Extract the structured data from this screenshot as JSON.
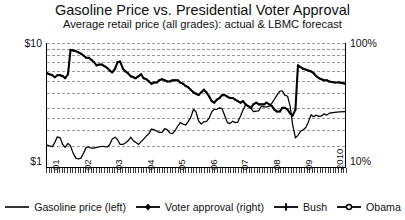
{
  "chart": {
    "title": "Gasoline Price vs. Presidential Voter Approval",
    "subtitle": "Average retail price (all grades): actual & LBMC forecast"
  },
  "axes": {
    "left_top_label": "$10",
    "left_bottom_label": "$1",
    "right_top_label": "100%",
    "right_bottom_label": "10%"
  },
  "legend": {
    "items": [
      {
        "label": "Gasoline price (left)",
        "marker": "line",
        "color": "#000000"
      },
      {
        "label": "Voter approval (right)",
        "marker": "line-diamond",
        "color": "#000000"
      },
      {
        "label": "Bush",
        "marker": "line-plus",
        "color": "#000000"
      },
      {
        "label": "Obama",
        "marker": "line-circle",
        "color": "#000000"
      }
    ]
  },
  "chart_data": {
    "type": "line",
    "title": "Gasoline Price vs. Presidential Voter Approval",
    "subtitle": "Average retail price (all grades): actual & LBMC forecast",
    "xlabel": "",
    "ylabel": "Gasoline price (USD per gallon)",
    "y2label": "Voter approval (%)",
    "yscale": "log",
    "y2scale": "log",
    "ylim": [
      1,
      10
    ],
    "y2lim": [
      10,
      100
    ],
    "grid": true,
    "legend_position": "bottom",
    "x_tick_labels": [
      "01",
      "02",
      "03",
      "04",
      "05",
      "06",
      "07",
      "08",
      "09",
      "2010"
    ],
    "x_tick_values": [
      2001,
      2002,
      2003,
      2004,
      2005,
      2006,
      2007,
      2008,
      2009,
      2010
    ],
    "x_minor_ticks": "monthly",
    "xlim": [
      2001,
      2010.5
    ],
    "series": [
      {
        "name": "Gasoline price (left)",
        "axis": "left",
        "unit": "USD/gal",
        "marker": "none",
        "x": [
          2001.0,
          2001.08,
          2001.17,
          2001.25,
          2001.33,
          2001.42,
          2001.5,
          2001.58,
          2001.67,
          2001.75,
          2001.83,
          2001.92,
          2002.0,
          2002.08,
          2002.17,
          2002.25,
          2002.33,
          2002.42,
          2002.5,
          2002.58,
          2002.67,
          2002.75,
          2002.83,
          2002.92,
          2003.0,
          2003.08,
          2003.17,
          2003.25,
          2003.33,
          2003.42,
          2003.5,
          2003.58,
          2003.67,
          2003.75,
          2003.83,
          2003.92,
          2004.0,
          2004.08,
          2004.17,
          2004.25,
          2004.33,
          2004.42,
          2004.5,
          2004.58,
          2004.67,
          2004.75,
          2004.83,
          2004.92,
          2005.0,
          2005.08,
          2005.17,
          2005.25,
          2005.33,
          2005.42,
          2005.5,
          2005.58,
          2005.67,
          2005.75,
          2005.83,
          2005.92,
          2006.0,
          2006.08,
          2006.17,
          2006.25,
          2006.33,
          2006.42,
          2006.5,
          2006.58,
          2006.67,
          2006.75,
          2006.83,
          2006.92,
          2007.0,
          2007.08,
          2007.17,
          2007.25,
          2007.33,
          2007.42,
          2007.5,
          2007.58,
          2007.67,
          2007.75,
          2007.83,
          2007.92,
          2008.0,
          2008.08,
          2008.17,
          2008.25,
          2008.33,
          2008.42,
          2008.5,
          2008.58,
          2008.67,
          2008.75,
          2008.83,
          2008.92,
          2009.0,
          2009.08,
          2009.17,
          2009.25,
          2009.33,
          2009.42,
          2009.5,
          2009.58,
          2009.67,
          2009.75,
          2009.83,
          2009.92,
          2010.0,
          2010.17,
          2010.33,
          2010.5
        ],
        "y": [
          1.5,
          1.48,
          1.46,
          1.58,
          1.75,
          1.72,
          1.52,
          1.44,
          1.55,
          1.48,
          1.3,
          1.18,
          1.16,
          1.18,
          1.3,
          1.44,
          1.45,
          1.42,
          1.42,
          1.44,
          1.45,
          1.47,
          1.46,
          1.45,
          1.52,
          1.68,
          1.74,
          1.66,
          1.52,
          1.52,
          1.56,
          1.62,
          1.74,
          1.63,
          1.58,
          1.52,
          1.6,
          1.68,
          1.78,
          1.86,
          2.02,
          2.0,
          1.94,
          1.9,
          1.9,
          2.04,
          2.0,
          1.88,
          1.86,
          1.96,
          2.14,
          2.28,
          2.22,
          2.18,
          2.32,
          2.5,
          2.92,
          2.78,
          2.36,
          2.22,
          2.32,
          2.32,
          2.48,
          2.78,
          2.92,
          2.92,
          3.0,
          2.96,
          2.58,
          2.28,
          2.24,
          2.34,
          2.28,
          2.3,
          2.58,
          2.88,
          3.16,
          3.08,
          2.98,
          2.8,
          2.82,
          2.84,
          3.08,
          3.06,
          3.06,
          3.08,
          3.28,
          3.52,
          3.8,
          4.08,
          4.12,
          3.8,
          3.72,
          3.1,
          2.2,
          1.72,
          1.8,
          1.94,
          2.0,
          2.08,
          2.3,
          2.64,
          2.54,
          2.62,
          2.56,
          2.58,
          2.68,
          2.62,
          2.72,
          2.76,
          2.78,
          2.8
        ]
      },
      {
        "name": "Voter approval (right)",
        "axis": "right",
        "unit": "%",
        "marker": "diamond",
        "x": [
          2001.0,
          2001.08,
          2001.17,
          2001.25,
          2001.33,
          2001.42,
          2001.5,
          2001.58,
          2001.67,
          2001.75,
          2001.83,
          2001.92,
          2002.0,
          2002.08,
          2002.17,
          2002.25,
          2002.33,
          2002.42,
          2002.5,
          2002.58,
          2002.67,
          2002.75,
          2002.83,
          2002.92,
          2003.0,
          2003.08,
          2003.17,
          2003.25,
          2003.33,
          2003.42,
          2003.5,
          2003.58,
          2003.67,
          2003.75,
          2003.83,
          2003.92,
          2004.0,
          2004.08,
          2004.17,
          2004.25,
          2004.33,
          2004.42,
          2004.5,
          2004.58,
          2004.67,
          2004.75,
          2004.83,
          2004.92,
          2005.0,
          2005.08,
          2005.17,
          2005.25,
          2005.33,
          2005.42,
          2005.5,
          2005.58,
          2005.67,
          2005.75,
          2005.83,
          2005.92,
          2006.0,
          2006.08,
          2006.17,
          2006.25,
          2006.33,
          2006.42,
          2006.5,
          2006.58,
          2006.67,
          2006.75,
          2006.83,
          2006.92,
          2007.0,
          2007.08,
          2007.17,
          2007.25,
          2007.33,
          2007.42,
          2007.5,
          2007.58,
          2007.67,
          2007.75,
          2007.83,
          2007.92,
          2008.0,
          2008.08,
          2008.17,
          2008.25,
          2008.33,
          2008.42,
          2008.5,
          2008.58,
          2008.67,
          2008.75,
          2008.83,
          2008.92,
          2009.0,
          2009.08,
          2009.17,
          2009.25,
          2009.33,
          2009.42,
          2009.5,
          2009.58,
          2009.67,
          2009.75,
          2009.83,
          2009.92,
          2010.0,
          2010.17,
          2010.33,
          2010.5
        ],
        "y": [
          57,
          56,
          55,
          53,
          55,
          55,
          54,
          52,
          56,
          88,
          87,
          86,
          84,
          82,
          79,
          76,
          76,
          73,
          70,
          66,
          67,
          67,
          65,
          63,
          60,
          58,
          62,
          70,
          71,
          62,
          59,
          57,
          54,
          53,
          52,
          54,
          56,
          52,
          51,
          49,
          47,
          48,
          48,
          50,
          51,
          50,
          49,
          49,
          50,
          50,
          50,
          48,
          47,
          45,
          44,
          42,
          40,
          39,
          38,
          40,
          42,
          40,
          37,
          34,
          33,
          35,
          36,
          38,
          38,
          37,
          36,
          36,
          35,
          34,
          33,
          34,
          32,
          31,
          30,
          32,
          33,
          32,
          32,
          32,
          33,
          32,
          31,
          29,
          28,
          28,
          30,
          30,
          29,
          27,
          26,
          29,
          66,
          64,
          62,
          61,
          60,
          59,
          57,
          54,
          52,
          51,
          50,
          50,
          49,
          48,
          48,
          47
        ]
      },
      {
        "name": "Bush",
        "axis": "right",
        "marker": "plus",
        "note": "President in office 2001-01 through 2009-01",
        "x_range": [
          2001.0,
          2009.05
        ]
      },
      {
        "name": "Obama",
        "axis": "right",
        "marker": "circle",
        "note": "President in office 2009-01 onward",
        "x_range": [
          2009.05,
          2010.5
        ]
      }
    ],
    "annotations": [
      {
        "text": "Gasoline price peaks above $4.00/gal in mid-2008, then collapses below $1.80 by end of 2008"
      },
      {
        "text": "Voter approval jumps from high-20s to mid-60s at the January 2009 presidential transition"
      }
    ]
  }
}
